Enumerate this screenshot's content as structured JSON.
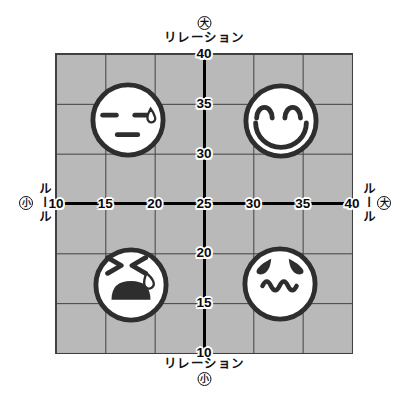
{
  "canvas": {
    "width": 401,
    "height": 404,
    "background": "#ffffff"
  },
  "chart_data": {
    "type": "scatter",
    "grid": {
      "background": "#b9b9b9",
      "line_color": "#404040",
      "divisions": 6
    },
    "x_axis": {
      "label": "ルール",
      "min": 10,
      "max": 40,
      "ticks": [
        10,
        15,
        20,
        25,
        30,
        35,
        40
      ],
      "low_label": "小",
      "high_label": "大"
    },
    "y_axis": {
      "label": "リレーション",
      "min": 10,
      "max": 40,
      "ticks": [
        40,
        35,
        30,
        25,
        20,
        15,
        10
      ],
      "low_label": "小",
      "high_label": "大"
    },
    "axis_cross": {
      "x": 25,
      "y": 25
    },
    "points": [
      {
        "face": "unamused-sweat",
        "x": 17.3,
        "y": 33.4
      },
      {
        "face": "smiling",
        "x": 32.8,
        "y": 33.3
      },
      {
        "face": "crying",
        "x": 17.6,
        "y": 16.8
      },
      {
        "face": "worried",
        "x": 32.7,
        "y": 16.9
      }
    ],
    "colors": {
      "face_fill": "#ffffff",
      "face_stroke": "#2e2e2e",
      "axis_line": "#000000",
      "tick_text": "#0a0a0a",
      "tick_halo": "#ffffff"
    }
  }
}
